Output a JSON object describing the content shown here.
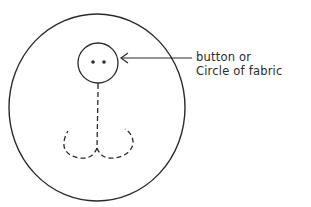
{
  "diagram": {
    "type": "sewing-illustration",
    "annotation": {
      "line1": "button or",
      "line2": "Circle of fabric"
    },
    "colors": {
      "ink": "#2a2a2a",
      "background": "#ffffff"
    }
  }
}
